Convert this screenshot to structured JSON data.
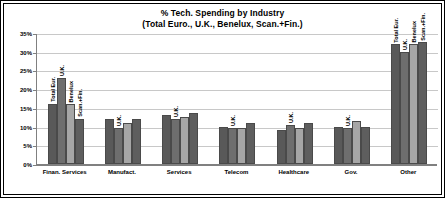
{
  "chart_data": {
    "type": "bar",
    "title": "% Tech. Spending by Industry",
    "subtitle": "(Total Euro., U.K., Benelux, Scan.+Fin.)",
    "xlabel": "",
    "ylabel": "",
    "ylim": [
      0,
      35
    ],
    "ytick_labels": [
      "35%",
      "30%",
      "25%",
      "20%",
      "15%",
      "10%",
      "5%",
      "0%"
    ],
    "ytick_values": [
      35,
      30,
      25,
      20,
      15,
      10,
      5,
      0
    ],
    "grid": true,
    "legend_position": "none",
    "categories": [
      "Finan. Services",
      "Manufact.",
      "Services",
      "Telecom",
      "Healthcare",
      "Gov.",
      "Other"
    ],
    "series": [
      {
        "name": "Total Eur.",
        "color": "#595959",
        "values": [
          16.0,
          12.0,
          13.0,
          10.0,
          9.0,
          10.0,
          32.0
        ]
      },
      {
        "name": "U.K.",
        "color": "#6e6e6e",
        "values": [
          23.0,
          9.5,
          12.0,
          9.5,
          10.5,
          9.5,
          30.0
        ]
      },
      {
        "name": "Benelux",
        "color": "#a6a6a6",
        "values": [
          16.0,
          11.0,
          12.5,
          9.5,
          9.5,
          11.5,
          32.0
        ]
      },
      {
        "name": "Scan.+Fin.",
        "color": "#5e5e5e",
        "values": [
          12.0,
          12.0,
          13.5,
          11.0,
          11.0,
          10.0,
          32.5
        ]
      }
    ],
    "bar_annotations": [
      [
        "Total Eur.",
        "U.K.",
        "Benelux",
        "Scan.+Fin."
      ],
      [
        "",
        "U.K.",
        "",
        ""
      ],
      [
        "",
        "U.K.",
        "",
        ""
      ],
      [
        "",
        "U.K.",
        "",
        ""
      ],
      [
        "",
        "U.K.",
        "",
        ""
      ],
      [
        "",
        "U.K.",
        "",
        ""
      ],
      [
        "Total Eur.",
        "U.K.",
        "Benelux",
        "Scan.+Fin."
      ]
    ]
  },
  "colors": {
    "frame": "#000000",
    "background": "#ffffff",
    "gridline": "#c8c8c8",
    "axis": "#808080",
    "text": "#000000"
  }
}
